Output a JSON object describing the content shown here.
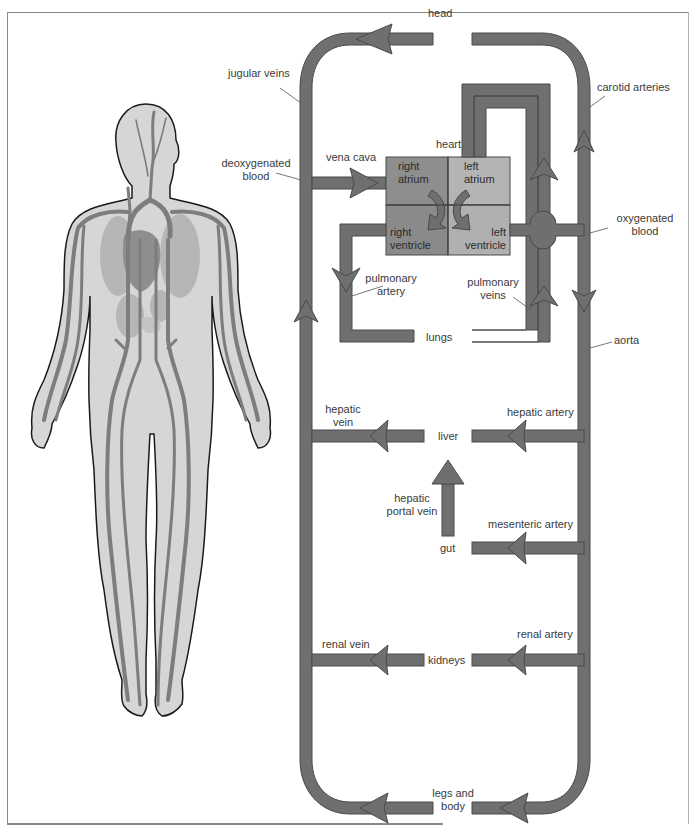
{
  "diagram": {
    "colors": {
      "vessel": "#6f6f6f",
      "vessel_outline": "#4a4a4a",
      "right_atrium": "#8e8e8e",
      "right_ventricle": "#8a8a8a",
      "left_atrium": "#b4b4b4",
      "left_ventricle": "#b0b0b0",
      "body_fill": "#d6d6d6",
      "body_outline": "#1a1a1a",
      "text": "#3a3a3a"
    },
    "organs": {
      "head": "head",
      "heart": "heart",
      "lungs": "lungs",
      "liver": "liver",
      "gut": "gut",
      "kidneys": "kidneys",
      "legs_and_body_line1": "legs and",
      "legs_and_body_line2": "body"
    },
    "heart_chambers": {
      "right_atrium_1": "right",
      "right_atrium_2": "atrium",
      "left_atrium_1": "left",
      "left_atrium_2": "atrium",
      "right_ventricle_1": "right",
      "right_ventricle_2": "ventricle",
      "left_ventricle_1": "left",
      "left_ventricle_2": "ventricle"
    },
    "vessels": {
      "jugular_veins": "jugular veins",
      "carotid_arteries": "carotid arteries",
      "deoxygenated_blood_1": "deoxygenated",
      "deoxygenated_blood_2": "blood",
      "vena_cava": "vena cava",
      "oxygenated_blood_1": "oxygenated",
      "oxygenated_blood_2": "blood",
      "pulmonary_artery_1": "pulmonary",
      "pulmonary_artery_2": "artery",
      "pulmonary_veins_1": "pulmonary",
      "pulmonary_veins_2": "veins",
      "aorta": "aorta",
      "hepatic_vein_1": "hepatic",
      "hepatic_vein_2": "vein",
      "hepatic_artery": "hepatic artery",
      "hepatic_portal_vein_1": "hepatic",
      "hepatic_portal_vein_2": "portal vein",
      "mesenteric_artery": "mesenteric artery",
      "renal_vein": "renal vein",
      "renal_artery": "renal artery"
    }
  }
}
